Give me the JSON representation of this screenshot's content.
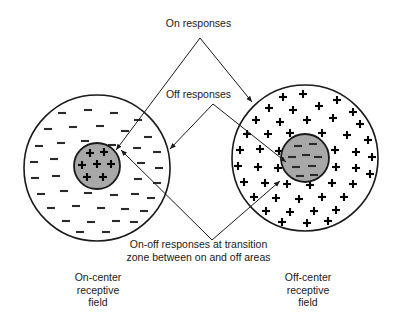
{
  "figure": {
    "background_color": "#ffffff",
    "ink_color": "#1a1a1a",
    "center_fill_color": "#a8a8a8"
  },
  "labels": {
    "on_responses": "On responses",
    "off_responses": "Off responses",
    "on_off_responses": "On-off responses at transition\nzone between on and off areas",
    "left_field": "On-center\nreceptive\nfield",
    "right_field": "Off-center\nreceptive\nfield"
  },
  "fields": [
    {
      "name": "on-center-receptive-field",
      "caption": "On-center\nreceptive\nfield",
      "center": {
        "x": 97,
        "y": 168
      },
      "radius": 73,
      "surround_sign": "minus",
      "center_disc": {
        "center": {
          "x": 97,
          "y": 166
        },
        "radius": 23,
        "sign": "plus",
        "fill": "#a8a8a8"
      }
    },
    {
      "name": "off-center-receptive-field",
      "caption": "Off-center\nreceptive\nfield",
      "center": {
        "x": 305,
        "y": 158
      },
      "radius": 73,
      "surround_sign": "plus",
      "center_disc": {
        "center": {
          "x": 305,
          "y": 158
        },
        "radius": 24,
        "sign": "minus",
        "fill": "#a8a8a8"
      }
    }
  ],
  "leaders": {
    "on_responses": {
      "apex": {
        "x": 200,
        "y": 38
      },
      "left_end": {
        "x": 113,
        "y": 152
      },
      "right_end": {
        "x": 249,
        "y": 100
      }
    },
    "off_responses": {
      "apex": {
        "x": 213,
        "y": 104
      },
      "left_end": {
        "x": 167,
        "y": 150
      },
      "right_end": {
        "x": 283,
        "y": 160
      }
    },
    "on_off_responses": {
      "apex": {
        "x": 212,
        "y": 240
      },
      "left_end": {
        "x": 118,
        "y": 148
      },
      "right_end": {
        "x": 277,
        "y": 180
      }
    }
  }
}
